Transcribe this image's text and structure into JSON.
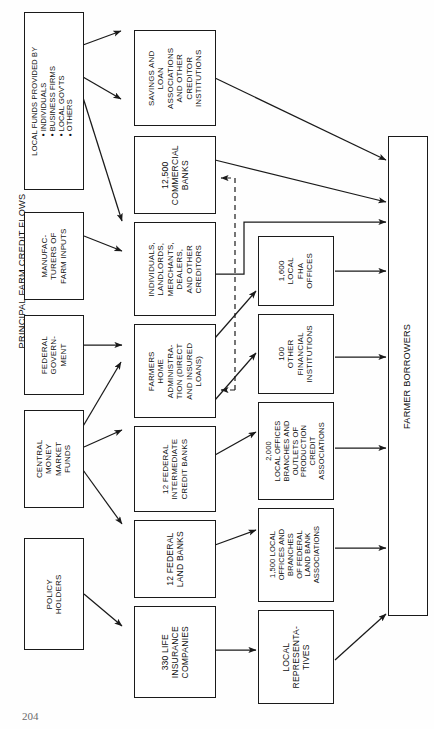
{
  "figure": {
    "title": "PRINCIPAL FARM CREDIT FLOWS",
    "page_number": "204",
    "orientation": "rotated-90-ccw",
    "line_color": "#1a1a1a",
    "background": "#ffffff"
  },
  "nodes": {
    "local_funds": {
      "header": "LOCAL FUNDS PROVIDED BY",
      "bullets": [
        "INDIVIDUALS",
        "BUSINESS FIRMS",
        "LOCAL GOV'TS",
        "OTHERS"
      ]
    },
    "manufacturers": {
      "lines": [
        "MANUFAC-",
        "TURERS OF",
        "FARM INPUTS"
      ]
    },
    "federal_government": {
      "lines": [
        "FEDERAL",
        "GOVERN-",
        "MENT"
      ]
    },
    "central_money": {
      "lines": [
        "CENTRAL",
        "MONEY",
        "MARKET",
        "FUNDS"
      ]
    },
    "policy_holders": {
      "lines": [
        "POLICY",
        "HOLDERS"
      ]
    },
    "savings_loan": {
      "lines": [
        "SAVINGS AND",
        "LOAN",
        "ASSOCIATIONS",
        "AND OTHER",
        "CREDITOR",
        "INSTITUTIONS"
      ]
    },
    "commercial_banks": {
      "lines": [
        "12,500",
        "COMMERCIAL",
        "BANKS"
      ]
    },
    "individuals_landlords": {
      "lines": [
        "INDIVIDUALS,",
        "LANDLORDS,",
        "MERCHANTS,",
        "DEALERS,",
        "AND OTHER",
        "CREDITORS"
      ]
    },
    "farmers_home": {
      "lines": [
        "FARMERS",
        "HOME",
        "ADMINISTRA-",
        "TION (DIRECT",
        "AND INSURED",
        "LOANS)"
      ]
    },
    "federal_intermediate": {
      "lines": [
        "12 FEDERAL",
        "INTERMEDIATE",
        "CREDIT BANKS"
      ]
    },
    "federal_land_banks": {
      "lines": [
        "12 FEDERAL",
        "LAND BANKS"
      ]
    },
    "life_insurance": {
      "lines": [
        "330 LIFE",
        "INSURANCE",
        "COMPANIES"
      ]
    },
    "fha_offices": {
      "lines": [
        "1,600",
        "LOCAL",
        "FHA",
        "OFFICES"
      ]
    },
    "other_financial": {
      "lines": [
        "100",
        "OTHER",
        "FINANCIAL",
        "INSTITUTIONS"
      ]
    },
    "pca_outlets": {
      "lines": [
        "2,000",
        "LOCAL OFFICES",
        "BRANCHES AND",
        "OUTLETS OF",
        "PRODUCTION",
        "CREDIT",
        "ASSOCIATIONS"
      ]
    },
    "flba_offices": {
      "lines": [
        "1,500 LOCAL",
        "OFFICES AND",
        "BRANCHES",
        "OF FEDERAL",
        "LAND BANK",
        "ASSOCIATIONS"
      ]
    },
    "local_reps": {
      "lines": [
        "LOCAL",
        "REPRESENTA-",
        "TIVES"
      ]
    },
    "farmer_borrowers": {
      "lines": [
        "FARMER BORROWERS"
      ]
    }
  },
  "flows": [
    {
      "from": "local_funds",
      "to": "savings_loan",
      "style": "solid"
    },
    {
      "from": "local_funds",
      "to": "commercial_banks",
      "style": "solid"
    },
    {
      "from": "local_funds",
      "to": "individuals_landlords",
      "style": "solid"
    },
    {
      "from": "manufacturers",
      "to": "individuals_landlords",
      "style": "solid"
    },
    {
      "from": "federal_government",
      "to": "farmers_home",
      "style": "solid"
    },
    {
      "from": "central_money",
      "to": "farmers_home",
      "style": "solid"
    },
    {
      "from": "central_money",
      "to": "federal_intermediate",
      "style": "solid"
    },
    {
      "from": "central_money",
      "to": "federal_land_banks",
      "style": "solid"
    },
    {
      "from": "policy_holders",
      "to": "life_insurance",
      "style": "solid"
    },
    {
      "from": "savings_loan",
      "to": "farmer_borrowers",
      "style": "solid"
    },
    {
      "from": "commercial_banks",
      "to": "farmer_borrowers",
      "style": "solid"
    },
    {
      "from": "individuals_landlords",
      "to": "farmer_borrowers",
      "style": "solid"
    },
    {
      "from": "farmers_home",
      "to": "fha_offices",
      "style": "solid"
    },
    {
      "from": "farmers_home",
      "to": "other_financial",
      "style": "solid"
    },
    {
      "from": "fha_offices",
      "to": "farmer_borrowers",
      "style": "solid"
    },
    {
      "from": "other_financial",
      "to": "farmer_borrowers",
      "style": "solid"
    },
    {
      "from": "federal_intermediate",
      "to": "pca_outlets",
      "style": "solid"
    },
    {
      "from": "pca_outlets",
      "to": "farmer_borrowers",
      "style": "solid"
    },
    {
      "from": "federal_land_banks",
      "to": "flba_offices",
      "style": "solid"
    },
    {
      "from": "flba_offices",
      "to": "farmer_borrowers",
      "style": "solid"
    },
    {
      "from": "life_insurance",
      "to": "local_reps",
      "style": "solid"
    },
    {
      "from": "local_reps",
      "to": "farmer_borrowers",
      "style": "solid"
    },
    {
      "from": "fha_offices",
      "to": "commercial_banks",
      "style": "dashed"
    }
  ]
}
